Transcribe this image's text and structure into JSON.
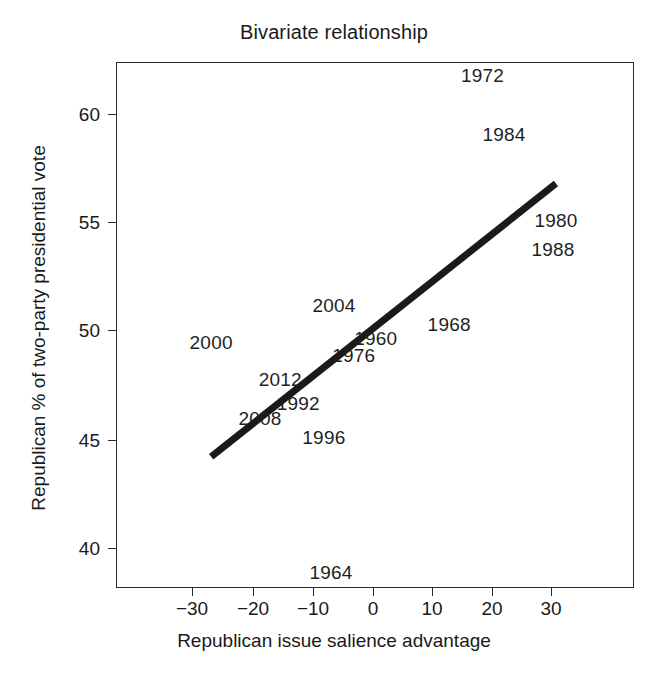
{
  "chart_data": {
    "type": "scatter",
    "title": "Bivariate relationship",
    "xlabel": "Republican issue salience advantage",
    "ylabel": "Republican % of two-party presidential vote",
    "xlim": [
      -39.5,
      43.5
    ],
    "ylim": [
      37.6,
      62.8
    ],
    "xticks": [
      -30,
      -20,
      -10,
      0,
      10,
      20,
      30
    ],
    "xticklabels": [
      "−30",
      "−20",
      "−10",
      "0",
      "10",
      "20",
      "30"
    ],
    "yticks": [
      40,
      45,
      50,
      55,
      60
    ],
    "yticklabels": [
      "40",
      "45",
      "50",
      "55",
      "60"
    ],
    "grid": false,
    "legend": false,
    "marker_style": "text-label",
    "points": [
      {
        "label": "1972",
        "x": 18.2,
        "y": 61.8
      },
      {
        "label": "1984",
        "x": 21.8,
        "y": 59.1
      },
      {
        "label": "1980",
        "x": 30.5,
        "y": 55.1
      },
      {
        "label": "1988",
        "x": 30.0,
        "y": 53.8
      },
      {
        "label": "1968",
        "x": 12.6,
        "y": 50.3
      },
      {
        "label": "2004",
        "x": -6.7,
        "y": 51.2
      },
      {
        "label": "1960",
        "x": 0.3,
        "y": 49.7
      },
      {
        "label": "1976",
        "x": -3.4,
        "y": 48.9
      },
      {
        "label": "2000",
        "x": -27.3,
        "y": 49.5
      },
      {
        "label": "2012",
        "x": -15.7,
        "y": 47.8
      },
      {
        "label": "1992",
        "x": -12.7,
        "y": 46.7
      },
      {
        "label": "2008",
        "x": -19.1,
        "y": 46.0
      },
      {
        "label": "1996",
        "x": -8.4,
        "y": 45.1
      },
      {
        "label": "1964",
        "x": -7.2,
        "y": 38.9
      }
    ],
    "trend_line": {
      "style": "solid",
      "color": "#1a1a1a",
      "width_px": 7,
      "x_start": -27.3,
      "y_start": 44.2,
      "x_end": 30.5,
      "y_end": 56.8
    }
  },
  "axes": {
    "y": [
      {
        "value": "60",
        "px": 114
      },
      {
        "value": "55",
        "px": 222
      },
      {
        "value": "50",
        "px": 330
      },
      {
        "value": "45",
        "px": 440
      },
      {
        "value": "40",
        "px": 548
      }
    ],
    "x": [
      {
        "value": "−30",
        "px": 192
      },
      {
        "value": "−20",
        "px": 253
      },
      {
        "value": "−10",
        "px": 313
      },
      {
        "value": "0",
        "px": 373
      },
      {
        "value": "10",
        "px": 432
      },
      {
        "value": "20",
        "px": 492
      },
      {
        "value": "30",
        "px": 551
      }
    ]
  },
  "style": {
    "ink": "#1a1a1a",
    "frame": "#2b2b2b",
    "background": "#ffffff"
  }
}
